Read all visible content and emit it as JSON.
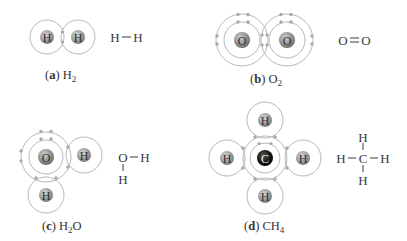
{
  "figure": {
    "panels": [
      {
        "id": "a",
        "letter": "a",
        "formula_main": "H",
        "formula_sub": "2",
        "formula_tail": "",
        "atoms": [
          "H",
          "H"
        ],
        "structural": {
          "left": "H",
          "right": "H",
          "bond": "single"
        }
      },
      {
        "id": "b",
        "letter": "b",
        "formula_main": "O",
        "formula_sub": "2",
        "formula_tail": "",
        "atoms": [
          "O",
          "O"
        ],
        "structural": {
          "left": "O",
          "right": "O",
          "bond": "double"
        }
      },
      {
        "id": "c",
        "letter": "c",
        "formula_main": "H",
        "formula_sub": "2",
        "formula_tail": "O",
        "atoms": [
          "O",
          "H",
          "H"
        ],
        "structural": {
          "center": "O",
          "right": "H",
          "bottom": "H"
        }
      },
      {
        "id": "d",
        "letter": "d",
        "formula_main": "CH",
        "formula_sub": "4",
        "formula_tail": "",
        "atoms": [
          "C",
          "H",
          "H",
          "H",
          "H"
        ],
        "structural": {
          "center": "C",
          "top": "H",
          "bottom": "H",
          "left": "H",
          "right": "H"
        }
      }
    ],
    "colors": {
      "shell": "#b8b8b8",
      "electron": "#a8a8a8",
      "hydrogen_nucleus": "#9a9a9a",
      "oxygen_nucleus": "#8c8c8c",
      "carbon_nucleus": "#1a1a1a",
      "text": "#3a3a3a"
    }
  }
}
